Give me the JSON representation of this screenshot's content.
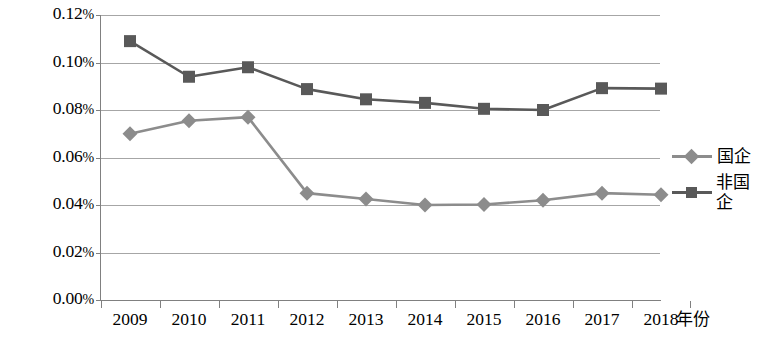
{
  "chart_data": {
    "type": "line",
    "title": "",
    "xlabel": "年份",
    "ylabel": "",
    "categories": [
      "2009",
      "2010",
      "2011",
      "2012",
      "2013",
      "2014",
      "2015",
      "2016",
      "2017",
      "2018"
    ],
    "ylim": [
      0.0,
      0.12
    ],
    "ytick_labels": [
      "0.12%",
      "0.10%",
      "0.08%",
      "0.06%",
      "0.04%",
      "0.02%",
      "0.00%"
    ],
    "ytick_values": [
      0.12,
      0.1,
      0.08,
      0.06,
      0.04,
      0.02,
      0.0
    ],
    "grid": true,
    "legend_position": "right",
    "units": "percent",
    "series": [
      {
        "name": "国企",
        "marker": "diamond",
        "color": "#8c8c8c",
        "values": [
          0.07,
          0.0755,
          0.077,
          0.045,
          0.0425,
          0.04,
          0.0402,
          0.042,
          0.045,
          0.0443
        ]
      },
      {
        "name": "非国企",
        "marker": "square",
        "color": "#595959",
        "values": [
          0.109,
          0.094,
          0.098,
          0.0888,
          0.0845,
          0.083,
          0.0805,
          0.08,
          0.0892,
          0.089
        ]
      }
    ]
  },
  "legend": {
    "items": [
      {
        "label": "国企",
        "marker": "diamond",
        "color": "#8c8c8c"
      },
      {
        "label": "非国企",
        "marker": "square",
        "color": "#595959"
      }
    ]
  },
  "axes": {
    "x_title": "年份"
  }
}
